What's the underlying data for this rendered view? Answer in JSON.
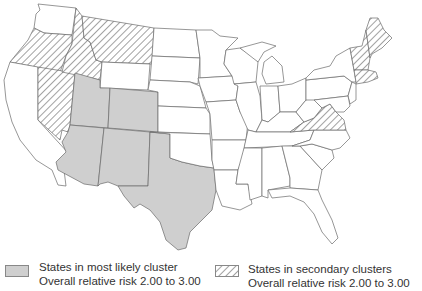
{
  "map": {
    "title": "",
    "region": "Contiguous United States",
    "colors": {
      "cluster_fill": "#cfcfcf",
      "hatch_stroke": "#555555",
      "border": "#6a6a6a",
      "background": "#ffffff"
    },
    "most_likely_cluster_states": [
      "Arizona",
      "Utah",
      "Colorado",
      "New Mexico",
      "Texas"
    ],
    "secondary_cluster_states": [
      "Oregon",
      "Idaho",
      "Montana",
      "Nevada",
      "Maine",
      "New Hampshire",
      "Vermont",
      "Massachusetts",
      "Virginia"
    ]
  },
  "legend": {
    "items": [
      {
        "pattern": "solid-gray",
        "line1": "States in most likely cluster",
        "line2": "Overall relative risk 2.00 to 3.00"
      },
      {
        "pattern": "diagonal-hatch",
        "line1": "States in secondary clusters",
        "line2": "Overall relative risk 2.00 to 3.00"
      }
    ]
  }
}
